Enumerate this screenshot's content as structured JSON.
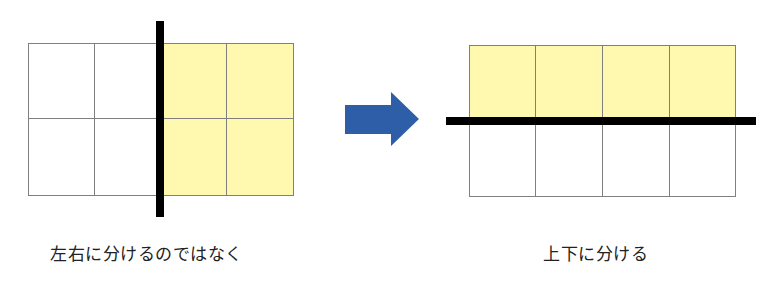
{
  "colors": {
    "highlight": "#fff9b0",
    "grid_line": "#7f7f7f",
    "divider": "#000000",
    "arrow": "#2f5ea8",
    "text": "#222222"
  },
  "left_panel": {
    "grid": {
      "rows": 2,
      "cols": 4,
      "highlighted_cols": [
        2,
        3
      ]
    },
    "divider": "vertical",
    "caption": "左右に分けるのではなく"
  },
  "arrow": {
    "direction": "right",
    "icon": "right-arrow-icon"
  },
  "right_panel": {
    "grid": {
      "rows": 2,
      "cols": 4,
      "highlighted_rows": [
        0
      ]
    },
    "divider": "horizontal",
    "caption": "上下に分ける"
  }
}
